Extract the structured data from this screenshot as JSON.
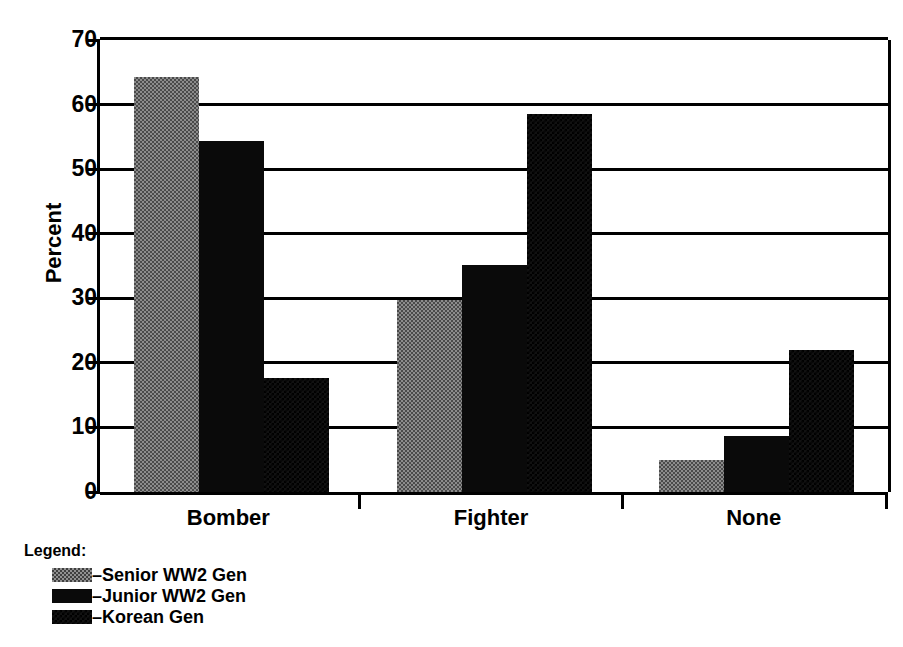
{
  "chart_data": {
    "type": "bar",
    "title": "",
    "subtitle": "",
    "xlabel": "",
    "ylabel": "Percent",
    "ylim": [
      0,
      70
    ],
    "yticks": [
      0,
      10,
      20,
      30,
      40,
      50,
      60,
      70
    ],
    "ytick_labels": [
      "0",
      "10",
      "20",
      "30",
      "40",
      "50",
      "60",
      "70"
    ],
    "grid": true,
    "legend_position": "below-left",
    "legend_title": "Legend:",
    "categories": [
      "Bomber",
      "Fighter",
      "None"
    ],
    "series": [
      {
        "name": "Senior WW2 Gen",
        "legend_label": "–Senior WW2 Gen",
        "swatch": "senior",
        "color": "#8c8c8c",
        "values": [
          64.2,
          29.7,
          5.0
        ]
      },
      {
        "name": "Junior WW2 Gen",
        "legend_label": "–Junior WW2 Gen",
        "swatch": "junior",
        "color": "#0a0a0a",
        "values": [
          54.4,
          35.2,
          8.7
        ]
      },
      {
        "name": "Korean Gen",
        "legend_label": "–Korean Gen",
        "swatch": "korean",
        "color": "#111111",
        "values": [
          17.7,
          58.6,
          22.0
        ]
      }
    ]
  }
}
